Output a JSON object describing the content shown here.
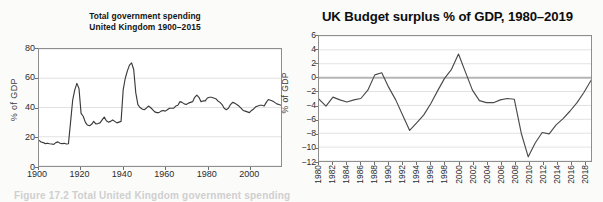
{
  "page": {
    "background": "#fbfbfa",
    "caption": "Figure 17.2  Total United Kingdom government spending"
  },
  "chart_data": [
    {
      "id": "uk-total-government-spending",
      "type": "line",
      "title": "Total government spending",
      "subtitle": "United Kingdom 1900–2015",
      "xlabel": "",
      "ylabel": "% of GDP",
      "xlim": [
        1900,
        2015
      ],
      "ylim": [
        0,
        80
      ],
      "yticks": [
        0,
        20,
        40,
        60,
        80
      ],
      "xticks": [
        1900,
        1920,
        1940,
        1960,
        1980,
        2000
      ],
      "grid": "horizontal",
      "legend": "none",
      "line_color": "#3a3a3a",
      "series": [
        {
          "name": "Total government spending, % of GDP",
          "x": [
            1900,
            1901,
            1902,
            1903,
            1904,
            1905,
            1906,
            1907,
            1908,
            1909,
            1910,
            1911,
            1912,
            1913,
            1914,
            1915,
            1916,
            1917,
            1918,
            1919,
            1920,
            1921,
            1922,
            1923,
            1924,
            1925,
            1926,
            1927,
            1928,
            1929,
            1930,
            1931,
            1932,
            1933,
            1934,
            1935,
            1936,
            1937,
            1938,
            1939,
            1940,
            1941,
            1942,
            1943,
            1944,
            1945,
            1946,
            1947,
            1948,
            1949,
            1950,
            1951,
            1952,
            1953,
            1954,
            1955,
            1956,
            1957,
            1958,
            1959,
            1960,
            1961,
            1962,
            1963,
            1964,
            1965,
            1966,
            1967,
            1968,
            1969,
            1970,
            1971,
            1972,
            1973,
            1974,
            1975,
            1976,
            1977,
            1978,
            1979,
            1980,
            1981,
            1982,
            1983,
            1984,
            1985,
            1986,
            1987,
            1988,
            1989,
            1990,
            1991,
            1992,
            1993,
            1994,
            1995,
            1996,
            1997,
            1998,
            1999,
            2000,
            2001,
            2002,
            2003,
            2004,
            2005,
            2006,
            2007,
            2008,
            2009,
            2010,
            2011,
            2012,
            2013,
            2014,
            2015
          ],
          "values": [
            17.5,
            16.4,
            16.0,
            15.3,
            15.6,
            15.2,
            15.0,
            14.8,
            16.0,
            16.5,
            15.6,
            15.3,
            15.5,
            15.0,
            15.2,
            30.0,
            45.0,
            52.0,
            56.5,
            53.0,
            36.0,
            34.0,
            30.0,
            28.0,
            27.5,
            28.5,
            30.5,
            28.8,
            29.0,
            29.5,
            31.5,
            33.5,
            31.0,
            30.0,
            30.5,
            31.5,
            30.5,
            29.5,
            30.0,
            30.5,
            52.0,
            60.0,
            65.0,
            69.0,
            70.5,
            66.0,
            50.0,
            42.0,
            40.0,
            39.0,
            38.5,
            39.5,
            41.0,
            40.0,
            38.5,
            37.0,
            36.5,
            36.5,
            37.5,
            38.0,
            37.5,
            38.5,
            39.5,
            39.5,
            39.5,
            41.0,
            41.5,
            44.0,
            43.5,
            42.5,
            42.0,
            43.0,
            43.5,
            44.0,
            47.0,
            48.5,
            47.0,
            44.0,
            44.5,
            44.5,
            46.5,
            47.0,
            47.0,
            46.5,
            46.0,
            44.5,
            43.5,
            42.0,
            39.5,
            38.5,
            39.5,
            42.0,
            43.5,
            43.0,
            42.0,
            41.0,
            39.5,
            38.0,
            37.5,
            37.0,
            36.5,
            38.0,
            39.0,
            40.5,
            41.0,
            41.5,
            41.5,
            41.0,
            43.5,
            45.5,
            45.0,
            44.5,
            43.5,
            42.5,
            42.0,
            41.5
          ]
        }
      ]
    },
    {
      "id": "uk-budget-surplus",
      "type": "line",
      "title": "UK Budget surplus % of GDP, 1980–2019",
      "xlabel": "",
      "ylabel": "% of GDP",
      "xlim": [
        1980,
        2019
      ],
      "ylim": [
        -12,
        6
      ],
      "yticks": [
        6,
        4,
        2,
        0,
        -2,
        -4,
        -6,
        -8,
        -10,
        -12
      ],
      "xticks": [
        1980,
        1982,
        1984,
        1986,
        1988,
        1990,
        1992,
        1994,
        1996,
        1998,
        2000,
        2002,
        2004,
        2006,
        2008,
        2010,
        2012,
        2014,
        2016,
        2018
      ],
      "ytick_labels": [
        "6",
        "4",
        "2",
        "0",
        "−2",
        "−4",
        "−6",
        "−8",
        "−10",
        "−12"
      ],
      "xtick_labels": [
        "1980",
        "1982",
        "1984",
        "1986",
        "1988",
        "1990",
        "1992",
        "1994",
        "1996",
        "1998",
        "2000",
        "2002",
        "2004",
        "2006",
        "2008",
        "2010",
        "2012",
        "2014",
        "2016",
        "2018"
      ],
      "grid": "horizontal",
      "zero_line": true,
      "legend": "none",
      "line_color": "#4a4a4a",
      "series": [
        {
          "name": "Budget surplus, % of GDP",
          "x": [
            1980,
            1981,
            1982,
            1983,
            1984,
            1985,
            1986,
            1987,
            1988,
            1989,
            1990,
            1991,
            1992,
            1993,
            1994,
            1995,
            1996,
            1997,
            1998,
            1999,
            2000,
            2001,
            2002,
            2003,
            2004,
            2005,
            2006,
            2007,
            2008,
            2009,
            2010,
            2011,
            2012,
            2013,
            2014,
            2015,
            2016,
            2017,
            2018,
            2019
          ],
          "values": [
            -3.1,
            -4.1,
            -2.8,
            -3.2,
            -3.5,
            -3.2,
            -3.0,
            -1.8,
            0.4,
            0.7,
            -1.4,
            -3.2,
            -5.4,
            -7.6,
            -6.5,
            -5.4,
            -3.8,
            -1.9,
            -0.1,
            1.2,
            3.4,
            0.8,
            -1.8,
            -3.3,
            -3.6,
            -3.6,
            -3.2,
            -3.0,
            -3.1,
            -8.0,
            -11.4,
            -9.4,
            -7.9,
            -8.1,
            -6.8,
            -5.9,
            -4.8,
            -3.6,
            -2.1,
            -0.4
          ]
        }
      ]
    }
  ]
}
